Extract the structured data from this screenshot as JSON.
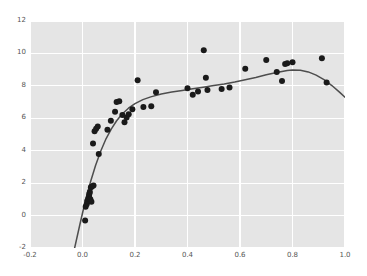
{
  "chart_data": {
    "type": "scatter",
    "title": "",
    "xlabel": "",
    "ylabel": "",
    "xlim": [
      -0.2,
      1.0
    ],
    "ylim": [
      -2,
      12
    ],
    "xticks": [
      "-0.2",
      "0.0",
      "0.2",
      "0.4",
      "0.6",
      "0.8",
      "1.0"
    ],
    "xtick_values": [
      -0.2,
      0.0,
      0.2,
      0.4,
      0.6,
      0.8,
      1.0
    ],
    "yticks": [
      "-2",
      "0",
      "2",
      "4",
      "6",
      "8",
      "10",
      "12"
    ],
    "ytick_values": [
      -2,
      0,
      2,
      4,
      6,
      8,
      10,
      12
    ],
    "grid": true,
    "grid_color": "#ffffff",
    "plot_background": "#e5e5e5",
    "figure_background": "#ffffff",
    "legend": null,
    "point_color": "#1a1a1a",
    "point_size": 3.0,
    "curve_color": "#4d4d4d",
    "series": [
      {
        "name": "observations",
        "type": "scatter",
        "x": [
          0.01,
          0.012,
          0.016,
          0.018,
          0.022,
          0.025,
          0.026,
          0.028,
          0.03,
          0.032,
          0.034,
          0.036,
          0.04,
          0.042,
          0.046,
          0.052,
          0.058,
          0.062,
          0.095,
          0.108,
          0.124,
          0.13,
          0.14,
          0.152,
          0.16,
          0.168,
          0.176,
          0.19,
          0.21,
          0.232,
          0.262,
          0.28,
          0.4,
          0.42,
          0.44,
          0.462,
          0.47,
          0.476,
          0.53,
          0.56,
          0.62,
          0.7,
          0.74,
          0.76,
          0.772,
          0.78,
          0.8,
          0.912,
          0.93
        ],
        "y": [
          -0.3,
          0.55,
          0.7,
          0.9,
          1.05,
          1.2,
          1.35,
          1.45,
          1.0,
          1.75,
          0.85,
          1.8,
          4.45,
          1.85,
          5.2,
          5.35,
          5.5,
          3.8,
          5.3,
          5.85,
          6.4,
          7.0,
          7.05,
          6.2,
          5.75,
          6.05,
          6.25,
          6.55,
          8.35,
          6.7,
          6.75,
          7.6,
          7.85,
          7.45,
          7.65,
          10.2,
          8.5,
          7.75,
          7.8,
          7.9,
          9.05,
          9.6,
          8.85,
          8.3,
          9.35,
          9.4,
          9.45,
          9.7,
          8.2
        ]
      },
      {
        "name": "fitted-curve",
        "type": "line",
        "x": [
          -0.03,
          -0.01,
          0.01,
          0.03,
          0.05,
          0.07,
          0.09,
          0.11,
          0.13,
          0.15,
          0.175,
          0.2,
          0.23,
          0.26,
          0.3,
          0.34,
          0.38,
          0.42,
          0.46,
          0.5,
          0.54,
          0.58,
          0.62,
          0.66,
          0.7,
          0.74,
          0.78,
          0.8,
          0.83,
          0.86,
          0.89,
          0.92,
          0.95,
          0.98,
          1.0
        ],
        "y": [
          -2.0,
          -0.55,
          0.85,
          2.05,
          3.1,
          4.0,
          4.75,
          5.35,
          5.85,
          6.25,
          6.62,
          6.9,
          7.15,
          7.32,
          7.5,
          7.62,
          7.72,
          7.82,
          7.92,
          8.02,
          8.12,
          8.24,
          8.38,
          8.52,
          8.68,
          8.82,
          8.95,
          8.98,
          8.96,
          8.86,
          8.66,
          8.38,
          8.02,
          7.6,
          7.3
        ]
      }
    ]
  }
}
